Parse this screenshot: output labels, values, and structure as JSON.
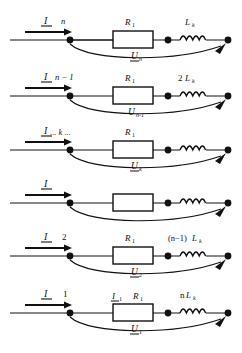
{
  "figure": {
    "type": "circuit-diagram",
    "colors": {
      "ink": "#111111",
      "background": "#ffffff"
    },
    "common": {
      "current_symbol": "I",
      "resistor_symbol": "R",
      "resistor_subscript": "1",
      "inductor_symbol": "L",
      "inductor_subscript": "k",
      "voltage_symbol": "U",
      "arrow_icon": "current-arrow-right",
      "voltage_arc_icon": "voltage-arc-arrow"
    },
    "rows": [
      {
        "id": "row-n",
        "index_label": "n",
        "current_label": "I",
        "current_underlined": true,
        "resistor_label": "R",
        "resistor_sub": "1",
        "inductor_label": "L",
        "inductor_sub": "k",
        "inductor_prefix": "",
        "voltage_label": "U",
        "voltage_sub": "n",
        "voltage_underlined": true,
        "branch_current_label": "",
        "branch_current_sub": ""
      },
      {
        "id": "row-n-minus-1",
        "index_label": "n − 1",
        "current_label": "I",
        "current_underlined": true,
        "resistor_label": "R",
        "resistor_sub": "1",
        "inductor_label": "L",
        "inductor_sub": "k",
        "inductor_prefix": "2",
        "voltage_label": "U",
        "voltage_sub": "n-1",
        "voltage_underlined": false,
        "branch_current_label": "",
        "branch_current_sub": ""
      },
      {
        "id": "row-k",
        "index_label": "... k ...",
        "current_label": "I",
        "current_underlined": true,
        "resistor_label": "R",
        "resistor_sub": "1",
        "inductor_label": "",
        "inductor_sub": "",
        "inductor_prefix": "",
        "voltage_label": "U",
        "voltage_sub": "k",
        "voltage_underlined": true,
        "branch_current_label": "",
        "branch_current_sub": ""
      },
      {
        "id": "row-ellipsis",
        "index_label": "",
        "current_label": "I",
        "current_underlined": true,
        "resistor_label": "",
        "resistor_sub": "",
        "inductor_label": "",
        "inductor_sub": "",
        "inductor_prefix": "",
        "voltage_label": "",
        "voltage_sub": "",
        "voltage_underlined": false,
        "branch_current_label": "",
        "branch_current_sub": ""
      },
      {
        "id": "row-2",
        "index_label": "2",
        "current_label": "I",
        "current_underlined": true,
        "resistor_label": "R",
        "resistor_sub": "1",
        "inductor_label": "L",
        "inductor_sub": "k",
        "inductor_prefix": "(n−1)",
        "voltage_label": "U",
        "voltage_sub": "2",
        "voltage_underlined": true,
        "branch_current_label": "",
        "branch_current_sub": ""
      },
      {
        "id": "row-1",
        "index_label": "1",
        "current_label": "I",
        "current_underlined": true,
        "resistor_label": "R",
        "resistor_sub": "1",
        "inductor_label": "L",
        "inductor_sub": "k",
        "inductor_prefix": "n",
        "voltage_label": "U",
        "voltage_sub": "1",
        "voltage_underlined": true,
        "branch_current_label": "I",
        "branch_current_sub": "1"
      }
    ]
  }
}
